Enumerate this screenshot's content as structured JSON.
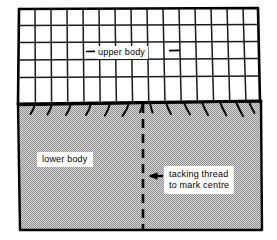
{
  "figure": {
    "background_color": "#ffffff",
    "ink_color": "#000000",
    "fabric_fill_color": "#b9b9b9"
  },
  "labels": {
    "upper_body": "upper body",
    "lower_body": "lower body",
    "tacking_line_1": "tacking thread",
    "tacking_line_2": "to mark  centre"
  },
  "parts": {
    "upper_body_piece": {
      "name": "upper body",
      "fill": "#ffffff",
      "grid_columns": 15,
      "grid_rows": 5,
      "description": "checked / gridded fabric panel at top"
    },
    "lower_body_piece": {
      "name": "lower body",
      "fill": "#b9b9b9",
      "description": "solid shaded fabric panel at bottom with gathers at the seam"
    },
    "seam": {
      "name": "joining seam",
      "gather_count": 14
    },
    "centre_marker": {
      "name": "tacking thread centre line",
      "style": "dashed vertical line",
      "x_position": 143
    },
    "pointer": {
      "name": "arrow pointing to centre line",
      "direction": "left"
    }
  }
}
